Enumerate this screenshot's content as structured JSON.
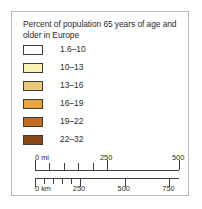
{
  "legend": {
    "title": "Percent of population 65 years of age and older in Europe",
    "classes": [
      {
        "label": "1.6–10",
        "color": "#ffffff",
        "swatch_name": "legend-swatch-1-6-10"
      },
      {
        "label": "10–13",
        "color": "#f7f1b5",
        "swatch_name": "legend-swatch-10-13"
      },
      {
        "label": "13–16",
        "color": "#e9c87a",
        "swatch_name": "legend-swatch-13-16"
      },
      {
        "label": "16–19",
        "color": "#e8a33d",
        "swatch_name": "legend-swatch-16-19"
      },
      {
        "label": "19–22",
        "color": "#c06a22",
        "swatch_name": "legend-swatch-19-22"
      },
      {
        "label": "22–32",
        "color": "#8a4618",
        "swatch_name": "legend-swatch-22-32"
      }
    ],
    "border_color": "#b9b9b9",
    "swatch_border_color": "#3d3d3d",
    "text_color": "#2b2b2b"
  },
  "scale_bar": {
    "miles": {
      "unit_label": "0 mi",
      "labels": [
        "250",
        "500"
      ],
      "label_positions_pct": [
        50,
        100
      ],
      "major_ticks_pct": [
        0,
        50,
        100
      ],
      "minor_ticks_pct": [
        10,
        20,
        30,
        40
      ],
      "max_value": 500
    },
    "kilometers": {
      "unit_label": "0 km",
      "labels": [
        "250",
        "750"
      ],
      "labels_all": [
        "250",
        "500",
        "750"
      ],
      "label_positions_pct": [
        31.1,
        62.2,
        93.3
      ],
      "major_ticks_pct": [
        0,
        31.1,
        62.2,
        93.3
      ],
      "minor_ticks_pct": [
        6.2,
        12.4,
        18.7,
        24.9
      ],
      "max_value": 750
    }
  }
}
